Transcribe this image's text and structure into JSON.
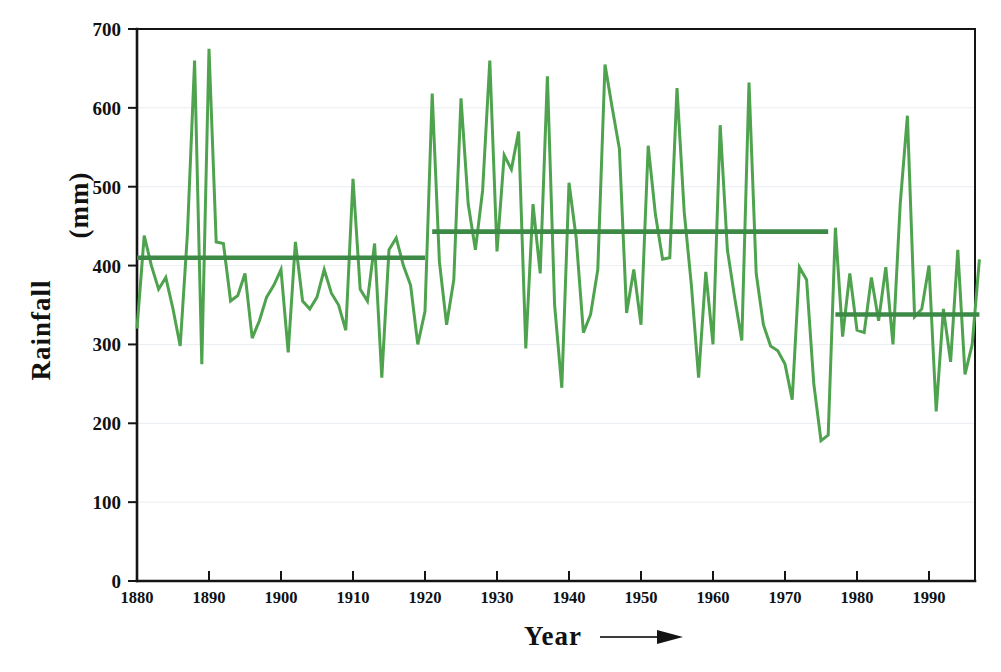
{
  "chart_data": {
    "type": "line",
    "title": "",
    "subtitle": "",
    "xlabel": "Year",
    "ylabel": "Rainfall   (mm)",
    "xlabel_suffix_icon": "right-arrow",
    "xlim": [
      1880,
      1997
    ],
    "ylim": [
      0,
      700
    ],
    "yticks": [
      0,
      100,
      200,
      300,
      400,
      500,
      600,
      700
    ],
    "ytick_labels": [
      "0",
      "100",
      "200",
      "300",
      "400",
      "500",
      "600",
      "700"
    ],
    "xticks": [
      1880,
      1890,
      1900,
      1910,
      1920,
      1930,
      1940,
      1950,
      1960,
      1970,
      1980,
      1990
    ],
    "xtick_labels": [
      "1880",
      "1890",
      "1900",
      "1910",
      "1920",
      "1930",
      "1940",
      "1950",
      "1960",
      "1970",
      "1980",
      "1990"
    ],
    "grid": "faint-horizontal",
    "legend": "none",
    "series": [
      {
        "name": "Annual rainfall",
        "color": "#4fa34f",
        "x": [
          1880,
          1881,
          1882,
          1883,
          1884,
          1885,
          1886,
          1887,
          1888,
          1889,
          1890,
          1891,
          1892,
          1893,
          1894,
          1895,
          1896,
          1897,
          1898,
          1899,
          1900,
          1901,
          1902,
          1903,
          1904,
          1905,
          1906,
          1907,
          1908,
          1909,
          1910,
          1911,
          1912,
          1913,
          1914,
          1915,
          1916,
          1917,
          1918,
          1919,
          1920,
          1921,
          1922,
          1923,
          1924,
          1925,
          1926,
          1927,
          1928,
          1929,
          1930,
          1931,
          1932,
          1933,
          1934,
          1935,
          1936,
          1937,
          1938,
          1939,
          1940,
          1941,
          1942,
          1943,
          1944,
          1945,
          1946,
          1947,
          1948,
          1949,
          1950,
          1951,
          1952,
          1953,
          1954,
          1955,
          1956,
          1957,
          1958,
          1959,
          1960,
          1961,
          1962,
          1963,
          1964,
          1965,
          1966,
          1967,
          1968,
          1969,
          1970,
          1971,
          1972,
          1973,
          1974,
          1975,
          1976,
          1977,
          1978,
          1979,
          1980,
          1981,
          1982,
          1983,
          1984,
          1985,
          1986,
          1987,
          1988,
          1989,
          1990,
          1991,
          1992,
          1993,
          1994,
          1995,
          1996,
          1997
        ],
        "y": [
          320,
          438,
          400,
          370,
          385,
          345,
          298,
          440,
          660,
          275,
          675,
          430,
          428,
          355,
          362,
          390,
          308,
          330,
          360,
          375,
          395,
          290,
          430,
          355,
          345,
          360,
          395,
          365,
          350,
          318,
          510,
          370,
          355,
          428,
          258,
          420,
          435,
          400,
          375,
          300,
          342,
          618,
          405,
          325,
          382,
          612,
          478,
          420,
          495,
          660,
          418,
          540,
          522,
          570,
          295,
          478,
          390,
          640,
          350,
          245,
          505,
          435,
          315,
          338,
          395,
          655,
          600,
          548,
          340,
          395,
          325,
          552,
          465,
          408,
          410,
          625,
          468,
          375,
          258,
          392,
          300,
          578,
          420,
          360,
          305,
          632,
          390,
          325,
          298,
          292,
          275,
          230,
          398,
          382,
          250,
          178,
          185,
          448,
          310,
          390,
          318,
          315,
          385,
          330,
          398,
          300,
          478,
          590,
          335,
          345,
          400,
          215,
          345,
          278,
          420,
          262,
          300,
          408
        ]
      }
    ],
    "mean_segments": [
      {
        "name": "mean-1880-1920",
        "start_year": 1880,
        "end_year": 1920,
        "value": 410,
        "color": "#3d8a47"
      },
      {
        "name": "mean-1921-1976",
        "start_year": 1921,
        "end_year": 1976,
        "value": 443,
        "color": "#3d8a47"
      },
      {
        "name": "mean-1977-1997",
        "start_year": 1977,
        "end_year": 1997,
        "value": 338,
        "color": "#3d8a47"
      }
    ]
  },
  "axes": {
    "x_title": "Year",
    "y_title_line1": "Rainfall",
    "y_title_line2": "(mm)"
  }
}
